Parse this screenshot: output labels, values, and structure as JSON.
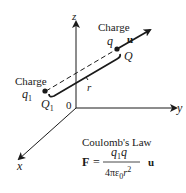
{
  "diagram": {
    "axes": {
      "z_label": "z",
      "y_label": "y",
      "x_label": "x",
      "origin_label": "0"
    },
    "charge_q": {
      "caption": "Charge",
      "symbol": "q",
      "point_label": "Q",
      "vector_label": "u"
    },
    "charge_q1": {
      "caption": "Charge",
      "symbol": "q",
      "symbol_sub": "1",
      "point_label": "Q",
      "point_sub": "1"
    },
    "distance_label": "r",
    "law": {
      "title": "Coulomb's Law",
      "lhs": "F",
      "equals": "=",
      "numerator_a": "q",
      "numerator_a_sub": "1",
      "numerator_b": "q",
      "denominator_prefix": "4πε",
      "denominator_sub": "0",
      "denominator_r": "r",
      "denominator_exp": "2",
      "unit_vector": "u"
    },
    "colors": {
      "ink": "#1a1a1a",
      "background": "#ffffff"
    }
  }
}
